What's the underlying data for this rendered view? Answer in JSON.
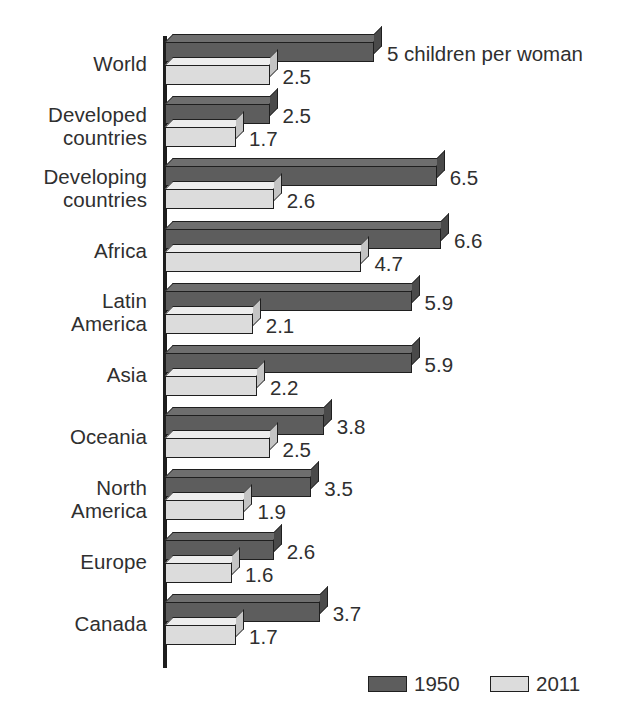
{
  "chart_data": {
    "type": "bar",
    "orientation": "horizontal",
    "title": "",
    "xlabel": "",
    "ylabel": "",
    "annotation": "5 children per woman",
    "grid": false,
    "legend_position": "bottom-right",
    "xlim": [
      0,
      7
    ],
    "categories": [
      "World",
      "Developed\ncountries",
      "Developing\ncountries",
      "Africa",
      "Latin\nAmerica",
      "Asia",
      "Oceania",
      "North\nAmerica",
      "Europe",
      "Canada"
    ],
    "series": [
      {
        "name": "1950",
        "color": "#5d5d5d",
        "values": [
          5,
          2.5,
          6.5,
          6.6,
          5.9,
          5.9,
          3.8,
          3.5,
          2.6,
          3.7
        ],
        "labels": [
          "5 children per woman",
          "2.5",
          "6.5",
          "6.6",
          "5.9",
          "5.9",
          "3.8",
          "3.5",
          "2.6",
          "3.7"
        ]
      },
      {
        "name": "2011",
        "color": "#dcdcdc",
        "values": [
          2.5,
          1.7,
          2.6,
          4.7,
          2.1,
          2.2,
          2.5,
          1.9,
          1.6,
          1.7
        ],
        "labels": [
          "2.5",
          "1.7",
          "2.6",
          "4.7",
          "2.1",
          "2.2",
          "2.5",
          "1.9",
          "1.6",
          "1.7"
        ]
      }
    ]
  },
  "legend": {
    "items": [
      {
        "label": "1950",
        "color": "#5d5d5d"
      },
      {
        "label": "2011",
        "color": "#dcdcdc"
      }
    ]
  }
}
